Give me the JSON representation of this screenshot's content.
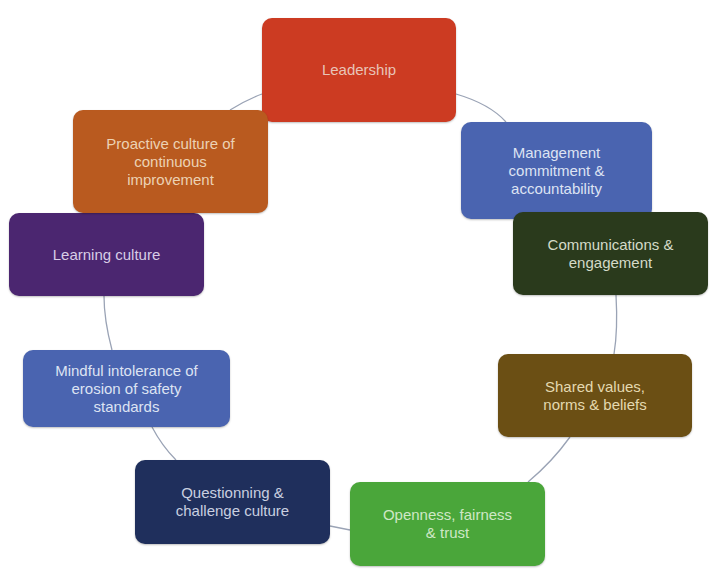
{
  "diagram": {
    "type": "cycle",
    "connector_color": "#9aa3b5",
    "nodes": [
      {
        "id": "leadership",
        "label": "Leadership",
        "bg": "#cc3b22",
        "fg": "#e8c4b8",
        "x": 262,
        "y": 18,
        "w": 194,
        "h": 104
      },
      {
        "id": "management",
        "label": "Management\ncommitment &\naccountability",
        "bg": "#4a64b0",
        "fg": "#dde3f3",
        "x": 461,
        "y": 122,
        "w": 191,
        "h": 97
      },
      {
        "id": "communications",
        "label": "Communications &\nengagement",
        "bg": "#2a3a1c",
        "fg": "#d4dbc8",
        "x": 513,
        "y": 212,
        "w": 195,
        "h": 83
      },
      {
        "id": "shared-values",
        "label": "Shared values,\nnorms & beliefs",
        "bg": "#6b4f14",
        "fg": "#e4d9b0",
        "x": 498,
        "y": 354,
        "w": 194,
        "h": 83
      },
      {
        "id": "openness",
        "label": "Openness, fairness\n& trust",
        "bg": "#4aa63a",
        "fg": "#cfe8c6",
        "x": 350,
        "y": 482,
        "w": 195,
        "h": 84
      },
      {
        "id": "questionning",
        "label": "Questionning &\nchallenge culture",
        "bg": "#1f2f5c",
        "fg": "#c9cfe0",
        "x": 135,
        "y": 460,
        "w": 195,
        "h": 84
      },
      {
        "id": "mindful",
        "label": "Mindful intolerance of\nerosion of safety\nstandards",
        "bg": "#4a64b0",
        "fg": "#dde3f3",
        "x": 23,
        "y": 350,
        "w": 207,
        "h": 77
      },
      {
        "id": "learning",
        "label": "Learning culture",
        "bg": "#4b2670",
        "fg": "#d8cde6",
        "x": 9,
        "y": 213,
        "w": 195,
        "h": 83
      },
      {
        "id": "proactive",
        "label": "Proactive culture of\ncontinuous\nimprovement",
        "bg": "#b95a1f",
        "fg": "#ecd2b4",
        "x": 73,
        "y": 110,
        "w": 195,
        "h": 103
      }
    ]
  }
}
